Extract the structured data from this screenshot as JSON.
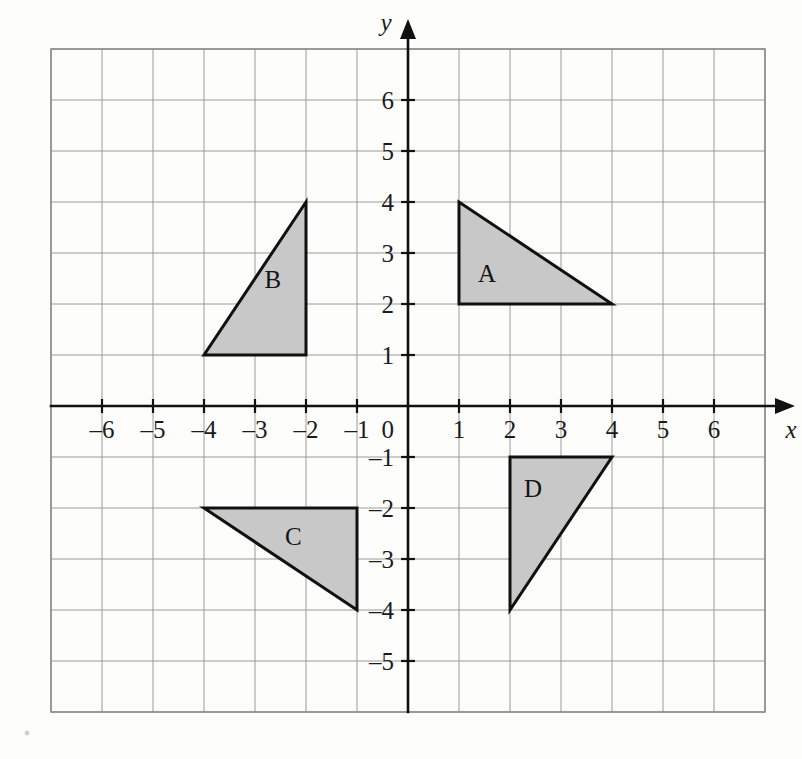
{
  "figure": {
    "kind": "coordinate-grid-with-triangles",
    "background_color": "#fdfdfc",
    "grid_color": "#9a9a9a",
    "axis_color": "#111111",
    "shape_fill": "#c8c8c8",
    "shape_stroke": "#111111"
  },
  "chart_data": {
    "type": "scatter",
    "title": "",
    "xlabel": "x",
    "ylabel": "y",
    "xlim": [
      -7,
      7
    ],
    "ylim": [
      -6,
      7
    ],
    "grid": true,
    "legend": "none",
    "x_tick_labels": [
      "–6",
      "–5",
      "–4",
      "–3",
      "–2",
      "–1",
      "1",
      "2",
      "3",
      "4",
      "5",
      "6"
    ],
    "x_tick_values": [
      -6,
      -5,
      -4,
      -3,
      -2,
      -1,
      1,
      2,
      3,
      4,
      5,
      6
    ],
    "y_tick_labels": [
      "6",
      "5",
      "4",
      "3",
      "2",
      "1",
      "–1",
      "–2",
      "–3",
      "–4",
      "–5"
    ],
    "y_tick_values": [
      6,
      5,
      4,
      3,
      2,
      1,
      -1,
      -2,
      -3,
      -4,
      -5
    ],
    "origin_label": "0",
    "annotations": [
      {
        "label": "A",
        "x": 1.55,
        "y": 2.6
      },
      {
        "label": "B",
        "x": -2.65,
        "y": 2.5
      },
      {
        "label": "C",
        "x": -2.25,
        "y": -2.55
      },
      {
        "label": "D",
        "x": 2.45,
        "y": -1.6
      }
    ],
    "series": [
      {
        "name": "A",
        "type": "polygon",
        "label": "A",
        "vertices": [
          [
            1,
            4
          ],
          [
            1,
            2
          ],
          [
            4,
            2
          ]
        ],
        "fill": "#c8c8c8"
      },
      {
        "name": "B",
        "type": "polygon",
        "label": "B",
        "vertices": [
          [
            -2,
            4
          ],
          [
            -4,
            1
          ],
          [
            -2,
            1
          ]
        ],
        "fill": "#c8c8c8"
      },
      {
        "name": "C",
        "type": "polygon",
        "label": "C",
        "vertices": [
          [
            -4,
            -2
          ],
          [
            -1,
            -2
          ],
          [
            -1,
            -4
          ]
        ],
        "fill": "#c8c8c8"
      },
      {
        "name": "D",
        "type": "polygon",
        "label": "D",
        "vertices": [
          [
            2,
            -1
          ],
          [
            4,
            -1
          ],
          [
            2,
            -4
          ]
        ],
        "fill": "#c8c8c8"
      }
    ]
  },
  "axes": {
    "x_axis_label": "x",
    "y_axis_label": "y"
  }
}
